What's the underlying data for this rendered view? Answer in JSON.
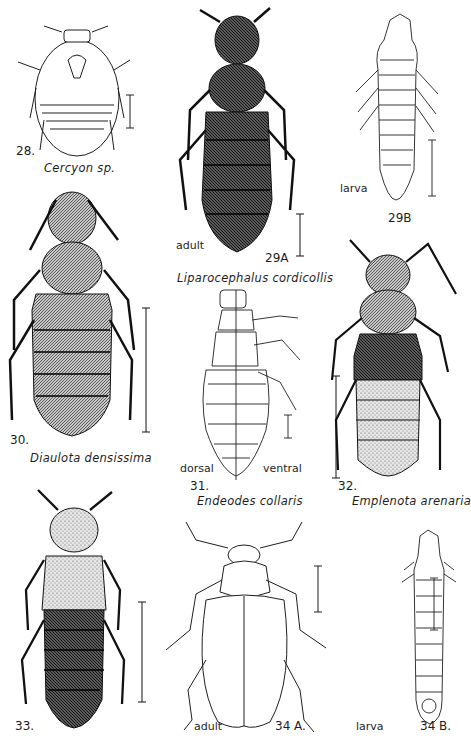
{
  "plate": {
    "figures": [
      {
        "id": "28",
        "number_label": "28.",
        "caption": "Cercyon sp.",
        "stage": ""
      },
      {
        "id": "29A",
        "number_label": "29A",
        "caption": "Liparocephalus cordicollis",
        "stage": "adult"
      },
      {
        "id": "29B",
        "number_label": "29B",
        "caption": "",
        "stage": "larva"
      },
      {
        "id": "30",
        "number_label": "30.",
        "caption": "Diaulota densissima",
        "stage": ""
      },
      {
        "id": "31",
        "number_label": "31.",
        "caption": "Endeodes collaris",
        "stage": "",
        "left_label": "dorsal",
        "right_label": "ventral"
      },
      {
        "id": "32",
        "number_label": "32.",
        "caption": "Emplenota arenaria",
        "stage": ""
      },
      {
        "id": "33",
        "number_label": "33.",
        "caption": "",
        "stage": ""
      },
      {
        "id": "34A",
        "number_label": "34 A.",
        "caption": "",
        "stage": "adult"
      },
      {
        "id": "34B",
        "number_label": "34 B.",
        "caption": "",
        "stage": "larva"
      }
    ]
  },
  "colors": {
    "ink": "#1e1e1e",
    "paper": "#ffffff",
    "shade": "#6b6b6b"
  }
}
